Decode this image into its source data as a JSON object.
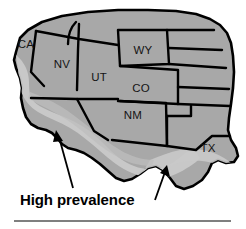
{
  "figure": {
    "kind": "map",
    "region_title": "Western United States",
    "background_color": "#ffffff"
  },
  "colors": {
    "land_fill": "#a8a8a8",
    "high_prevalence_fill": "#c9c9c9",
    "border_stroke": "#000000",
    "label_text": "#141414",
    "callout_text": "#000000",
    "rule_color": "#555555"
  },
  "map": {
    "states": [
      {
        "code": "CA",
        "label": "CA",
        "label_x": 26,
        "label_y": 48
      },
      {
        "code": "NV",
        "label": "NV",
        "label_x": 62,
        "label_y": 68
      },
      {
        "code": "UT",
        "label": "UT",
        "label_x": 99,
        "label_y": 81
      },
      {
        "code": "WY",
        "label": "WY",
        "label_x": 143,
        "label_y": 54
      },
      {
        "code": "CO",
        "label": "CO",
        "label_x": 141,
        "label_y": 92
      },
      {
        "code": "NM",
        "label": "NM",
        "label_x": 133,
        "label_y": 119
      },
      {
        "code": "TX",
        "label": "TX",
        "label_x": 208,
        "label_y": 152
      }
    ]
  },
  "annotations": {
    "high_prevalence": {
      "label": "High prevalence",
      "label_x": 20,
      "label_y": 205,
      "arrows": [
        {
          "name": "arrow-left",
          "from_x": 73,
          "from_y": 188,
          "to_x": 58,
          "to_y": 135
        },
        {
          "name": "arrow-right",
          "from_x": 155,
          "from_y": 200,
          "to_x": 165,
          "to_y": 169
        }
      ]
    }
  },
  "footer": {
    "rule_visible": true,
    "rule_y": 221,
    "rule_x_start": 14,
    "rule_x_end": 231
  }
}
